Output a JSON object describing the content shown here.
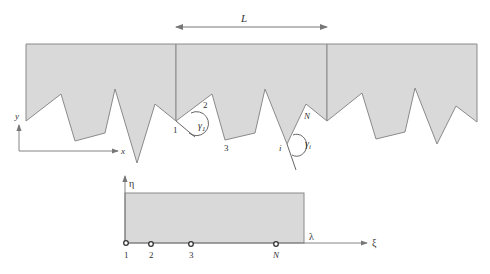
{
  "figure": {
    "period_label": "L",
    "top_axes": {
      "y_label": "y",
      "x_label": "x"
    },
    "vertex_labels": {
      "first": "1",
      "second": "2",
      "third": "3",
      "last": "N",
      "generic": "i"
    },
    "angle_labels": {
      "gamma_1": "γ",
      "gamma_1_sub": "1",
      "gamma_i": "γ",
      "gamma_i_sub": "i"
    },
    "bottom_axes": {
      "vertical_label": "η",
      "horizontal_label": "ξ",
      "period_label": "λ"
    },
    "bottom_points": [
      {
        "label": "1",
        "x": 126
      },
      {
        "label": "2",
        "x": 151
      },
      {
        "label": "3",
        "x": 191
      },
      {
        "label": "N",
        "x": 276
      }
    ],
    "colors": {
      "fill": "#d9d9d9",
      "stroke": "#8a8a8a",
      "text": "#333333"
    }
  }
}
